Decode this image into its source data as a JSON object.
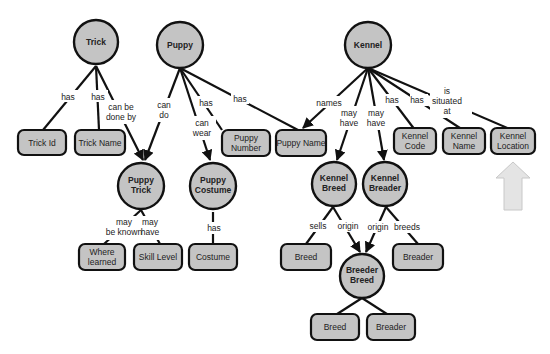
{
  "diagram": {
    "type": "entity-relationship concept map",
    "colors": {
      "node_fill": "#c4c4c4",
      "stroke": "#111111",
      "background": "#ffffff",
      "highlight_arrow": "#e4e4e4"
    },
    "entities": [
      {
        "id": "trick",
        "label": "Trick"
      },
      {
        "id": "puppy",
        "label": "Puppy"
      },
      {
        "id": "kennel",
        "label": "Kennel"
      },
      {
        "id": "puppy_trick",
        "label_lines": [
          "Puppy",
          "Trick"
        ]
      },
      {
        "id": "puppy_costume",
        "label_lines": [
          "Puppy",
          "Costume"
        ]
      },
      {
        "id": "kennel_breed",
        "label_lines": [
          "Kennel",
          "Breed"
        ]
      },
      {
        "id": "kennel_breader",
        "label_lines": [
          "Kennel",
          "Breader"
        ]
      },
      {
        "id": "breeder_breed",
        "label_lines": [
          "Breeder",
          "Breed"
        ]
      }
    ],
    "attributes": [
      {
        "id": "trick_id",
        "label_lines": [
          "Trick Id"
        ]
      },
      {
        "id": "trick_name",
        "label_lines": [
          "Trick Name"
        ]
      },
      {
        "id": "puppy_number",
        "label_lines": [
          "Puppy",
          "Number"
        ]
      },
      {
        "id": "puppy_name",
        "label_lines": [
          "Puppy Name"
        ]
      },
      {
        "id": "kennel_code",
        "label_lines": [
          "Kennel",
          "Code"
        ]
      },
      {
        "id": "kennel_name",
        "label_lines": [
          "Kennel",
          "Name"
        ]
      },
      {
        "id": "kennel_location",
        "label_lines": [
          "Kennel",
          "Location"
        ]
      },
      {
        "id": "where_learned",
        "label_lines": [
          "Where",
          "learned"
        ]
      },
      {
        "id": "skill_level",
        "label_lines": [
          "Skill Level"
        ]
      },
      {
        "id": "costume",
        "label_lines": [
          "Costume"
        ]
      },
      {
        "id": "breed_1",
        "label_lines": [
          "Breed"
        ]
      },
      {
        "id": "breader_1",
        "label_lines": [
          "Breader"
        ]
      },
      {
        "id": "breed_2",
        "label_lines": [
          "Breed"
        ]
      },
      {
        "id": "breader_2",
        "label_lines": [
          "Breader"
        ]
      }
    ],
    "relationships": [
      {
        "from": "trick",
        "to": "trick_id",
        "label_lines": [
          "has"
        ]
      },
      {
        "from": "trick",
        "to": "trick_name",
        "label_lines": [
          "has"
        ]
      },
      {
        "from": "trick",
        "to": "puppy_trick",
        "label_lines": [
          "can be",
          "done by"
        ]
      },
      {
        "from": "puppy",
        "to": "puppy_trick",
        "label_lines": [
          "can",
          "do"
        ]
      },
      {
        "from": "puppy",
        "to": "puppy_costume",
        "label_lines": [
          "can",
          "wear"
        ]
      },
      {
        "from": "puppy",
        "to": "puppy_number",
        "label_lines": [
          "has"
        ]
      },
      {
        "from": "puppy",
        "to": "puppy_name",
        "label_lines": [
          "has"
        ]
      },
      {
        "from": "kennel",
        "to": "puppy_name",
        "label_lines": [
          "names"
        ]
      },
      {
        "from": "kennel",
        "to": "kennel_breed",
        "label_lines": [
          "may",
          "have"
        ]
      },
      {
        "from": "kennel",
        "to": "kennel_breader",
        "label_lines": [
          "may",
          "have"
        ]
      },
      {
        "from": "kennel",
        "to": "kennel_code",
        "label_lines": [
          "has"
        ]
      },
      {
        "from": "kennel",
        "to": "kennel_name",
        "label_lines": [
          "has"
        ]
      },
      {
        "from": "kennel",
        "to": "kennel_location",
        "label_lines": [
          "is",
          "situated",
          "at"
        ]
      },
      {
        "from": "puppy_trick",
        "to": "where_learned",
        "label_lines": [
          "may",
          "be known"
        ]
      },
      {
        "from": "puppy_trick",
        "to": "skill_level",
        "label_lines": [
          "may",
          "have"
        ]
      },
      {
        "from": "puppy_costume",
        "to": "costume",
        "label_lines": [
          "has"
        ]
      },
      {
        "from": "kennel_breed",
        "to": "breed_1",
        "label_lines": [
          "sells"
        ]
      },
      {
        "from": "kennel_breed",
        "to": "breeder_breed",
        "label_lines": [
          "origin"
        ]
      },
      {
        "from": "kennel_breader",
        "to": "breeder_breed",
        "label_lines": [
          "origin"
        ]
      },
      {
        "from": "kennel_breader",
        "to": "breader_1",
        "label_lines": [
          "breeds"
        ]
      },
      {
        "from": "breeder_breed",
        "to": "breed_2",
        "label_lines": []
      },
      {
        "from": "breeder_breed",
        "to": "breader_2",
        "label_lines": []
      }
    ],
    "callout": {
      "shape": "up-arrow",
      "points_to": "kennel_location"
    }
  }
}
